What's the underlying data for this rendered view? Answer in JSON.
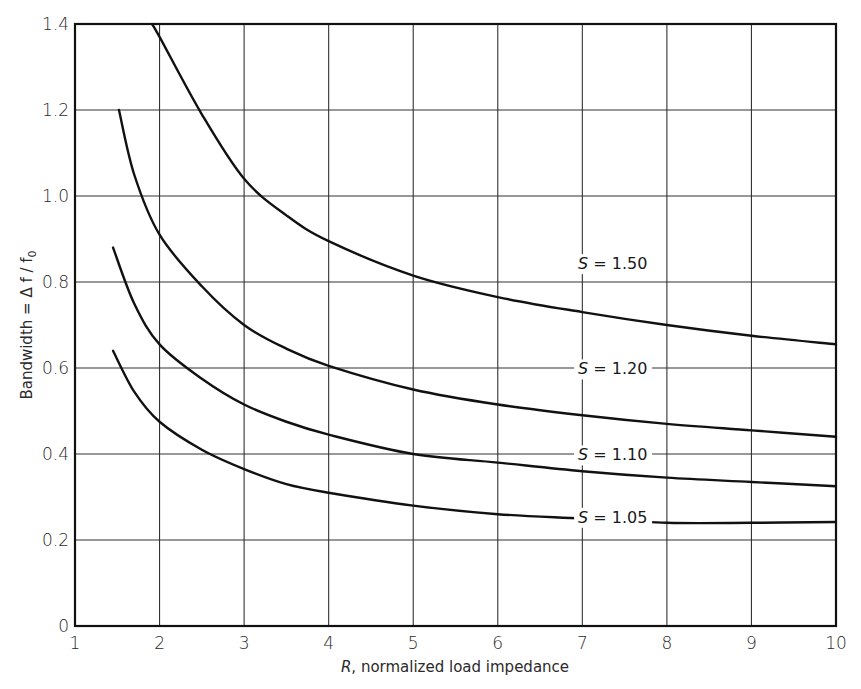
{
  "chart_data": {
    "type": "line",
    "title": "",
    "xlabel": "R, normalized load impedance",
    "ylabel": "Bandwidth = Δ f / f0",
    "xlim": [
      1,
      10
    ],
    "ylim": [
      0,
      1.4
    ],
    "xticks": [
      1,
      2,
      3,
      4,
      5,
      6,
      7,
      8,
      9,
      10
    ],
    "xtick_labels": [
      "1",
      "2",
      "3",
      "4",
      "5",
      "6",
      "7",
      "8",
      "9",
      "10"
    ],
    "yticks": [
      0,
      0.2,
      0.4,
      0.6,
      0.8,
      1.0,
      1.2,
      1.4
    ],
    "ytick_labels": [
      "0",
      "0.2",
      "0.4",
      "0.6",
      "0.8",
      "1.0",
      "1.2",
      "1.4"
    ],
    "grid": true,
    "legend": "inline curve labels",
    "series": [
      {
        "name": "S = 1.50",
        "label_at": [
          6.95,
          0.83
        ],
        "points": [
          [
            1.91,
            1.4
          ],
          [
            2,
            1.37
          ],
          [
            2.5,
            1.19
          ],
          [
            3,
            1.04
          ],
          [
            3.5,
            0.955
          ],
          [
            4,
            0.895
          ],
          [
            5,
            0.815
          ],
          [
            6,
            0.765
          ],
          [
            7,
            0.73
          ],
          [
            8,
            0.7
          ],
          [
            9,
            0.675
          ],
          [
            10,
            0.655
          ]
        ]
      },
      {
        "name": "S = 1.20",
        "label_at": [
          6.95,
          0.585
        ],
        "points": [
          [
            1.52,
            1.2
          ],
          [
            1.7,
            1.05
          ],
          [
            2,
            0.91
          ],
          [
            2.5,
            0.79
          ],
          [
            3,
            0.7
          ],
          [
            3.5,
            0.645
          ],
          [
            4,
            0.605
          ],
          [
            5,
            0.55
          ],
          [
            6,
            0.515
          ],
          [
            7,
            0.49
          ],
          [
            8,
            0.47
          ],
          [
            9,
            0.455
          ],
          [
            10,
            0.44
          ]
        ]
      },
      {
        "name": "S = 1.10",
        "label_at": [
          6.95,
          0.385
        ],
        "points": [
          [
            1.45,
            0.88
          ],
          [
            1.7,
            0.75
          ],
          [
            2,
            0.655
          ],
          [
            2.5,
            0.575
          ],
          [
            3,
            0.515
          ],
          [
            3.5,
            0.475
          ],
          [
            4,
            0.445
          ],
          [
            5,
            0.4
          ],
          [
            6,
            0.38
          ],
          [
            7,
            0.36
          ],
          [
            8,
            0.345
          ],
          [
            9,
            0.335
          ],
          [
            10,
            0.325
          ]
        ]
      },
      {
        "name": "S = 1.05",
        "label_at": [
          6.95,
          0.24
        ],
        "points": [
          [
            1.45,
            0.64
          ],
          [
            1.7,
            0.545
          ],
          [
            2,
            0.475
          ],
          [
            2.5,
            0.41
          ],
          [
            3,
            0.365
          ],
          [
            3.5,
            0.33
          ],
          [
            4,
            0.31
          ],
          [
            5,
            0.28
          ],
          [
            6,
            0.26
          ],
          [
            7,
            0.25
          ],
          [
            8,
            0.24
          ],
          [
            9,
            0.24
          ],
          [
            10,
            0.242
          ]
        ]
      }
    ]
  },
  "labels": {
    "x_axis_R": "R",
    "x_axis_rest": ", normalized load impedance",
    "y_axis": "Bandwidth = Δ f / f",
    "y_axis_sub": "0"
  },
  "colors": {
    "line": "#111111",
    "grid": "#333333",
    "background": "#ffffff"
  }
}
